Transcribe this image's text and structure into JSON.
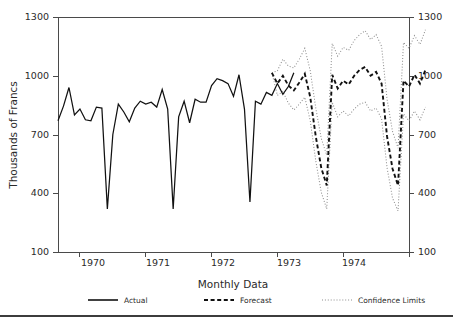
{
  "chart_data": {
    "type": "line",
    "title": "",
    "xlabel": "Monthly Data",
    "ylabel": "Thousands of Francs",
    "ylim": [
      100,
      1300
    ],
    "yticks": [
      100,
      400,
      700,
      1000,
      1300
    ],
    "ytick_labels": [
      "100",
      "400",
      "700",
      "1000",
      "1300"
    ],
    "y_axis_right": true,
    "y_right_tick_labels": [
      "100",
      "400",
      "700",
      "1000",
      "1300"
    ],
    "xlim": [
      1969.6667,
      1975.0
    ],
    "xticks": [
      1970,
      1971,
      1972,
      1973,
      1974,
      1975
    ],
    "xtick_labels": [
      "1970",
      "1971",
      "1972",
      "1973",
      "1974"
    ],
    "xtick_label_positions": [
      1970.5,
      1971.5,
      1972.5,
      1973.5,
      1974.5
    ],
    "grid": false,
    "legend_position": "bottom",
    "legend": [
      {
        "name": "Actual",
        "style": "solid",
        "color": "#111111"
      },
      {
        "name": "Forecast",
        "style": "dashed",
        "color": "#111111"
      },
      {
        "name": "Confidence Limits",
        "style": "dotted",
        "color": "#8d8d8d"
      }
    ],
    "series": [
      {
        "name": "Actual",
        "style": "solid",
        "x_start": 1969.6667,
        "x_step": 0.0833333,
        "values": [
          770,
          845,
          940,
          800,
          830,
          775,
          770,
          840,
          835,
          320,
          700,
          855,
          815,
          765,
          835,
          870,
          855,
          865,
          840,
          930,
          830,
          320,
          790,
          870,
          760,
          880,
          865,
          865,
          950,
          985,
          975,
          960,
          895,
          1005,
          830,
          355,
          870,
          855,
          915,
          900,
          960,
          905,
          945,
          1015
        ]
      },
      {
        "name": "Forecast",
        "style": "dashed",
        "x_start": 1972.9167,
        "x_step": 0.0833333,
        "values": [
          1015,
          960,
          1000,
          950,
          925,
          965,
          1010,
          890,
          690,
          530,
          440,
          1005,
          935,
          975,
          955,
          1000,
          1030,
          1045,
          1000,
          1020,
          960,
          690,
          525,
          440,
          975,
          945,
          1005,
          960,
          1030
        ]
      },
      {
        "name": "Confidence Limits Upper",
        "style": "dotted",
        "x_start": 1972.9167,
        "x_step": 0.0833333,
        "values": [
          1015,
          1025,
          1085,
          1050,
          1040,
          1085,
          1140,
          1025,
          835,
          680,
          595,
          1165,
          1100,
          1145,
          1130,
          1180,
          1210,
          1230,
          1185,
          1210,
          1150,
          880,
          715,
          630,
          1170,
          1140,
          1205,
          1160,
          1235
        ]
      },
      {
        "name": "Confidence Limits Lower",
        "style": "dotted",
        "x_start": 1972.9167,
        "x_step": 0.0833333,
        "values": [
          1015,
          900,
          920,
          860,
          825,
          855,
          890,
          770,
          565,
          405,
          320,
          865,
          790,
          820,
          795,
          830,
          855,
          865,
          820,
          835,
          780,
          530,
          375,
          310,
          805,
          770,
          820,
          775,
          840
        ]
      }
    ]
  },
  "legend_labels": {
    "actual": "Actual",
    "forecast": "Forecast",
    "confidence": "Confidence Limits"
  },
  "axis": {
    "x_title": "Monthly Data",
    "y_title": "Thousands of Francs",
    "y_top": "1300",
    "y_1000": "1000",
    "y_700": "700",
    "y_400": "400",
    "y_bottom": "100",
    "x_1970": "1970",
    "x_1971": "1971",
    "x_1972": "1972",
    "x_1973": "1973",
    "x_1974": "1974"
  }
}
